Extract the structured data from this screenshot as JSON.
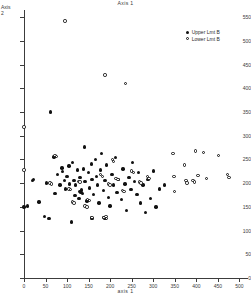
{
  "chart_data": {
    "type": "scatter",
    "title": "Axis 1",
    "xlabel": "axis 1",
    "ylabel": "Axis\n2",
    "xlim": [
      0,
      520
    ],
    "ylim": [
      0,
      565
    ],
    "grid": false,
    "legend_position": "top-right",
    "xticks": [
      0,
      50,
      100,
      150,
      200,
      250,
      300,
      350,
      400,
      450,
      500
    ],
    "yticks": [
      0,
      50,
      100,
      150,
      200,
      250,
      300,
      350,
      400,
      450,
      500,
      550
    ],
    "series": [
      {
        "name": "Upper Lmt B",
        "marker": "filled-circle",
        "color": "#111111",
        "points": [
          [
            0,
            150
          ],
          [
            8,
            152
          ],
          [
            20,
            205
          ],
          [
            22,
            208
          ],
          [
            35,
            160
          ],
          [
            48,
            130
          ],
          [
            52,
            200
          ],
          [
            58,
            125
          ],
          [
            62,
            350
          ],
          [
            70,
            255
          ],
          [
            72,
            178
          ],
          [
            78,
            218
          ],
          [
            84,
            196
          ],
          [
            88,
            232
          ],
          [
            90,
            225
          ],
          [
            94,
            205
          ],
          [
            96,
            188
          ],
          [
            100,
            214
          ],
          [
            104,
            236
          ],
          [
            106,
            198
          ],
          [
            110,
            118
          ],
          [
            112,
            244
          ],
          [
            116,
            206
          ],
          [
            118,
            174
          ],
          [
            120,
            196
          ],
          [
            124,
            228
          ],
          [
            128,
            168
          ],
          [
            130,
            212
          ],
          [
            134,
            186
          ],
          [
            138,
            230
          ],
          [
            140,
            276
          ],
          [
            142,
            204
          ],
          [
            146,
            162
          ],
          [
            150,
            222
          ],
          [
            152,
            190
          ],
          [
            156,
            240
          ],
          [
            158,
            208
          ],
          [
            162,
            176
          ],
          [
            166,
            250
          ],
          [
            168,
            214
          ],
          [
            170,
            196
          ],
          [
            174,
            158
          ],
          [
            178,
            228
          ],
          [
            180,
            262
          ],
          [
            184,
            184
          ],
          [
            188,
            206
          ],
          [
            192,
            238
          ],
          [
            196,
            170
          ],
          [
            200,
            152
          ],
          [
            204,
            218
          ],
          [
            208,
            196
          ],
          [
            212,
            254
          ],
          [
            216,
            180
          ],
          [
            220,
            208
          ],
          [
            226,
            166
          ],
          [
            230,
            230
          ],
          [
            234,
            198
          ],
          [
            238,
            142
          ],
          [
            244,
            212
          ],
          [
            248,
            186
          ],
          [
            252,
            244
          ],
          [
            256,
            204
          ],
          [
            262,
            176
          ],
          [
            266,
            222
          ],
          [
            270,
            158
          ],
          [
            276,
            196
          ],
          [
            282,
            138
          ],
          [
            288,
            208
          ],
          [
            294,
            168
          ],
          [
            300,
            226
          ],
          [
            306,
            150
          ],
          [
            314,
            188
          ],
          [
            156,
            128
          ],
          [
            158,
            126
          ],
          [
            186,
            128
          ],
          [
            188,
            126
          ],
          [
            130,
            182
          ],
          [
            132,
            180
          ],
          [
            134,
            184
          ],
          [
            136,
            178
          ],
          [
            326,
            196
          ]
        ]
      },
      {
        "name": "Lower Lmt B",
        "marker": "open-circle",
        "color": "#111111",
        "points": [
          [
            95,
            542
          ],
          [
            188,
            428
          ],
          [
            235,
            410
          ],
          [
            0,
            318
          ],
          [
            0,
            228
          ],
          [
            72,
            258
          ],
          [
            76,
            256
          ],
          [
            112,
            160
          ],
          [
            116,
            158
          ],
          [
            126,
            204
          ],
          [
            130,
            202
          ],
          [
            148,
            166
          ],
          [
            152,
            164
          ],
          [
            158,
            128
          ],
          [
            186,
            128
          ],
          [
            190,
            130
          ],
          [
            192,
            126
          ],
          [
            196,
            198
          ],
          [
            200,
            196
          ],
          [
            206,
            250
          ],
          [
            208,
            246
          ],
          [
            214,
            210
          ],
          [
            218,
            208
          ],
          [
            228,
            184
          ],
          [
            232,
            182
          ],
          [
            250,
            226
          ],
          [
            254,
            222
          ],
          [
            268,
            202
          ],
          [
            272,
            200
          ],
          [
            286,
            214
          ],
          [
            290,
            210
          ],
          [
            346,
            262
          ],
          [
            348,
            214
          ],
          [
            350,
            182
          ],
          [
            372,
            238
          ],
          [
            376,
            206
          ],
          [
            378,
            200
          ],
          [
            392,
            206
          ],
          [
            396,
            202
          ],
          [
            398,
            268
          ],
          [
            404,
            216
          ],
          [
            416,
            264
          ],
          [
            424,
            210
          ],
          [
            452,
            258
          ],
          [
            472,
            218
          ],
          [
            476,
            212
          ],
          [
            178,
            218
          ],
          [
            182,
            214
          ],
          [
            104,
            188
          ],
          [
            108,
            186
          ],
          [
            60,
            200
          ],
          [
            64,
            198
          ],
          [
            142,
            152
          ],
          [
            146,
            150
          ]
        ]
      }
    ]
  }
}
